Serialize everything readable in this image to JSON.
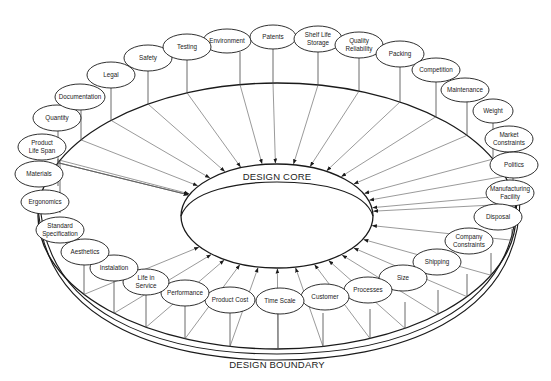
{
  "diagram": {
    "core_label": "DESIGN CORE",
    "boundary_label": "DESIGN BOUNDARY",
    "colors": {
      "stroke": "#1a1a1a",
      "thin": "#555555",
      "text": "#222222",
      "background": "#ffffff"
    },
    "nodes": [
      {
        "id": "environment",
        "lines": [
          "Environment"
        ],
        "cx": 227,
        "cy": 41,
        "rx": 24,
        "ry": 12,
        "ring_x": 240
      },
      {
        "id": "patents",
        "lines": [
          "Patents"
        ],
        "cx": 273,
        "cy": 37,
        "rx": 23,
        "ry": 12,
        "ring_x": 273
      },
      {
        "id": "shelf-life-storage",
        "lines": [
          "Shelf Life",
          "Storage"
        ],
        "cx": 318,
        "cy": 39,
        "rx": 24,
        "ry": 13,
        "ring_x": 318
      },
      {
        "id": "quality-reliability",
        "lines": [
          "Quality",
          "Reliability"
        ],
        "cx": 359,
        "cy": 45,
        "rx": 24,
        "ry": 13,
        "ring_x": 359
      },
      {
        "id": "packing",
        "lines": [
          "Packing"
        ],
        "cx": 400,
        "cy": 54,
        "rx": 24,
        "ry": 13,
        "ring_x": 400
      },
      {
        "id": "competition",
        "lines": [
          "Competition"
        ],
        "cx": 436,
        "cy": 70,
        "rx": 24,
        "ry": 12,
        "ring_x": 436
      },
      {
        "id": "maintenance",
        "lines": [
          "Maintenance"
        ],
        "cx": 465,
        "cy": 90,
        "rx": 24,
        "ry": 12,
        "ring_x": 467
      },
      {
        "id": "weight",
        "lines": [
          "Weight"
        ],
        "cx": 493,
        "cy": 111,
        "rx": 20,
        "ry": 12,
        "ring_x": 493
      },
      {
        "id": "market-constraints",
        "lines": [
          "Market",
          "Constraints"
        ],
        "cx": 509,
        "cy": 139,
        "rx": 24,
        "ry": 13,
        "ring_x": 505
      },
      {
        "id": "politics",
        "lines": [
          "Politics"
        ],
        "cx": 514,
        "cy": 165,
        "rx": 24,
        "ry": 13,
        "ring_x": 513
      },
      {
        "id": "manufacturing-facility",
        "lines": [
          "Manufacturing",
          "Facility"
        ],
        "cx": 510,
        "cy": 193,
        "rx": 24,
        "ry": 13,
        "ring_x": 515
      },
      {
        "id": "disposal",
        "lines": [
          "Disposal"
        ],
        "cx": 498,
        "cy": 217,
        "rx": 24,
        "ry": 13,
        "ring_x": 512
      },
      {
        "id": "company-constraints",
        "lines": [
          "Company",
          "Constraints"
        ],
        "cx": 469,
        "cy": 241,
        "rx": 24,
        "ry": 13,
        "ring_x": 491
      },
      {
        "id": "shipping",
        "lines": [
          "Shipping"
        ],
        "cx": 437,
        "cy": 262,
        "rx": 24,
        "ry": 13,
        "ring_x": 467
      },
      {
        "id": "size",
        "lines": [
          "Size"
        ],
        "cx": 403,
        "cy": 278,
        "rx": 24,
        "ry": 13,
        "ring_x": 438
      },
      {
        "id": "processes",
        "lines": [
          "Processes"
        ],
        "cx": 368,
        "cy": 290,
        "rx": 24,
        "ry": 13,
        "ring_x": 405
      },
      {
        "id": "customer",
        "lines": [
          "Customer"
        ],
        "cx": 325,
        "cy": 297,
        "rx": 24,
        "ry": 13,
        "ring_x": 370
      },
      {
        "id": "time-scale",
        "lines": [
          "Time Scale"
        ],
        "cx": 280,
        "cy": 301,
        "rx": 24,
        "ry": 13,
        "ring_x": 323
      },
      {
        "id": "product-cost",
        "lines": [
          "Product Cost"
        ],
        "cx": 230,
        "cy": 300,
        "rx": 25,
        "ry": 13,
        "ring_x": 278
      },
      {
        "id": "performance",
        "lines": [
          "Performance"
        ],
        "cx": 185,
        "cy": 293,
        "rx": 24,
        "ry": 13,
        "ring_x": 230
      },
      {
        "id": "life-in-service",
        "lines": [
          "Life in",
          "Service"
        ],
        "cx": 146,
        "cy": 282,
        "rx": 23,
        "ry": 13,
        "ring_x": 185
      },
      {
        "id": "instalation",
        "lines": [
          "Instalation"
        ],
        "cx": 114,
        "cy": 268,
        "rx": 24,
        "ry": 13,
        "ring_x": 146
      },
      {
        "id": "aesthetics",
        "lines": [
          "Aesthetics"
        ],
        "cx": 85,
        "cy": 252,
        "rx": 24,
        "ry": 13,
        "ring_x": 114
      },
      {
        "id": "standard-specification",
        "lines": [
          "Standard",
          "Specification"
        ],
        "cx": 60,
        "cy": 230,
        "rx": 24,
        "ry": 13,
        "ring_x": 84
      },
      {
        "id": "ergonomics",
        "lines": [
          "Ergonomics"
        ],
        "cx": 45,
        "cy": 202,
        "rx": 24,
        "ry": 12,
        "ring_x": 60
      },
      {
        "id": "materials",
        "lines": [
          "Materials"
        ],
        "cx": 39,
        "cy": 174,
        "rx": 24,
        "ry": 13,
        "ring_x": 58
      },
      {
        "id": "product-life-span",
        "lines": [
          "Product",
          "Life Span"
        ],
        "cx": 42,
        "cy": 147,
        "rx": 24,
        "ry": 13,
        "ring_x": 58
      },
      {
        "id": "quantity",
        "lines": [
          "Quantity"
        ],
        "cx": 57,
        "cy": 118,
        "rx": 24,
        "ry": 13,
        "ring_x": 58
      },
      {
        "id": "documentation",
        "lines": [
          "Documentation"
        ],
        "cx": 80,
        "cy": 97,
        "rx": 25,
        "ry": 13,
        "ring_x": 81
      },
      {
        "id": "legal",
        "lines": [
          "Legal"
        ],
        "cx": 111,
        "cy": 75,
        "rx": 24,
        "ry": 13,
        "ring_x": 111
      },
      {
        "id": "safety",
        "lines": [
          "Safety"
        ],
        "cx": 148,
        "cy": 58,
        "rx": 24,
        "ry": 13,
        "ring_x": 148
      },
      {
        "id": "testing",
        "lines": [
          "Testing"
        ],
        "cx": 187,
        "cy": 47,
        "rx": 24,
        "ry": 13,
        "ring_x": 187
      }
    ]
  }
}
